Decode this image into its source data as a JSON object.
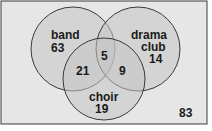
{
  "diagram": {
    "type": "venn",
    "colors": {
      "background": "#e6e6e6",
      "circle_fill": "#c4c4c4",
      "stroke": "#3a3a3a",
      "text": "#1a1a1a"
    },
    "sets": [
      {
        "name": "band",
        "label_lines": [
          "band"
        ],
        "only_count": "63"
      },
      {
        "name": "drama club",
        "label_lines": [
          "drama",
          "club"
        ],
        "only_count": "14"
      },
      {
        "name": "choir",
        "label_lines": [
          "choir"
        ],
        "only_count": "19"
      }
    ],
    "regions": {
      "band_only": "63",
      "drama_only": "14",
      "choir_only": "19",
      "band_choir_only": "21",
      "drama_choir_only": "9",
      "band_drama_choir": "5",
      "outside": "83"
    }
  }
}
